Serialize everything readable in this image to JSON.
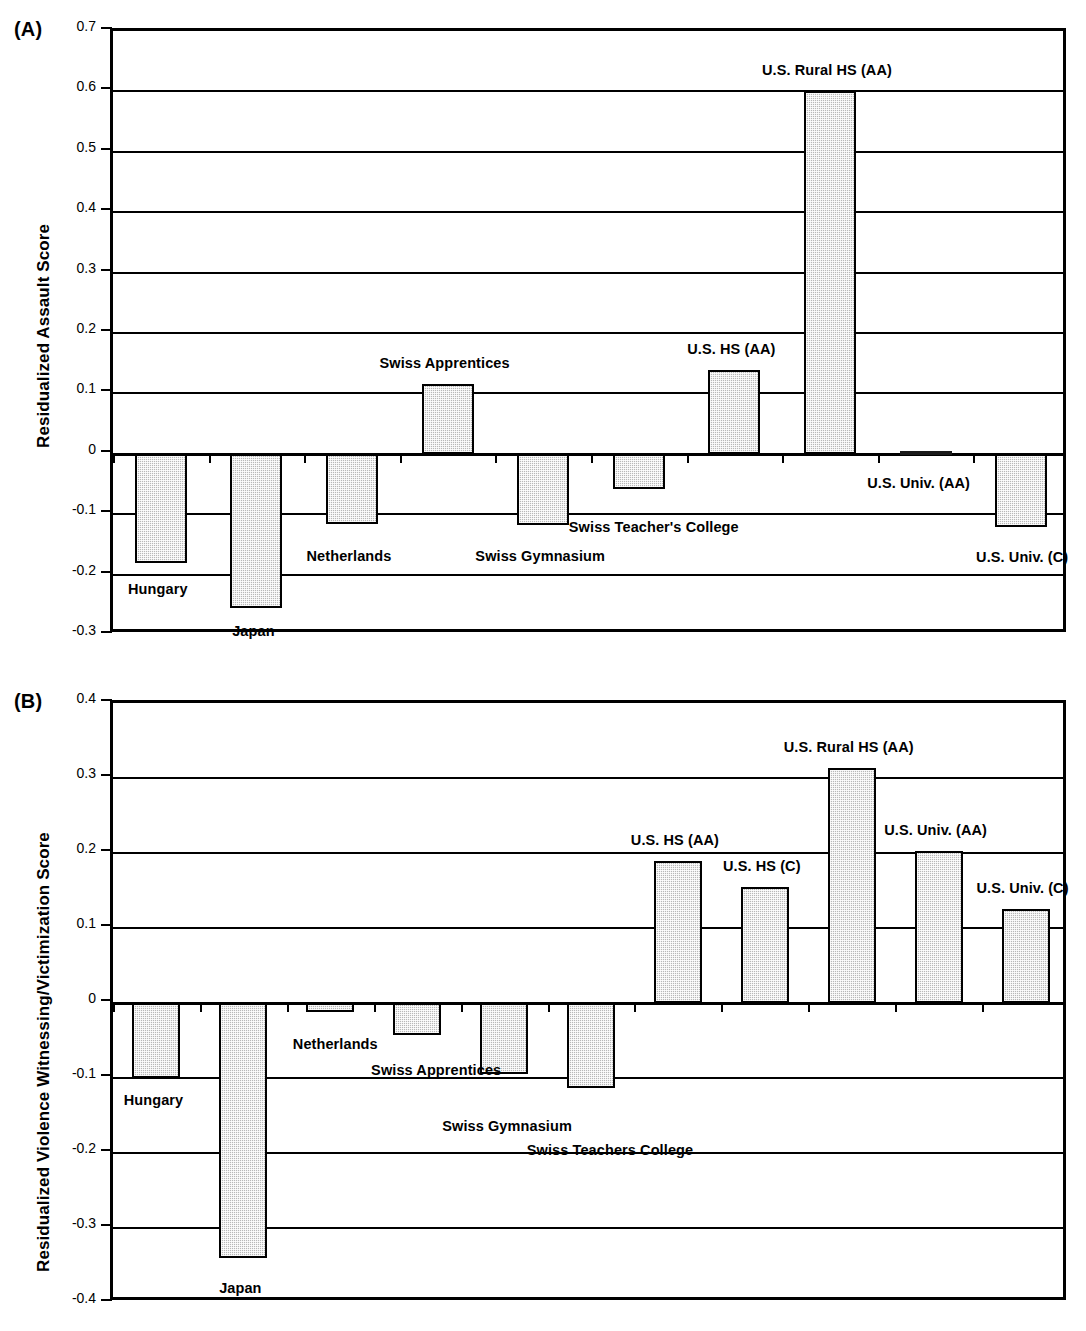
{
  "figure": {
    "panels": [
      {
        "letter": "(A)",
        "ylabel": "Residualized Assault Score"
      },
      {
        "letter": "(B)",
        "ylabel": "Residualized Violence Witnessing/Victimization Score"
      }
    ]
  },
  "chart_data": [
    {
      "type": "bar",
      "title": "(A)",
      "xlabel": "",
      "ylabel": "Residualized Assault Score",
      "ylim": [
        -0.3,
        0.7
      ],
      "ytick_labels": [
        "0.7",
        "0.6",
        "0.5",
        "0.4",
        "0.3",
        "0.2",
        "0.1",
        "0",
        "-0.1",
        "-0.2",
        "-0.3"
      ],
      "ytick_values": [
        0.7,
        0.6,
        0.5,
        0.4,
        0.3,
        0.2,
        0.1,
        0,
        -0.1,
        -0.2,
        -0.3
      ],
      "grid": true,
      "legend": "none",
      "categories": [
        "Hungary",
        "Japan",
        "Netherlands",
        "Swiss Apprentices",
        "Swiss Gymnasium",
        "Swiss Teacher's College",
        "U.S. HS (AA)",
        "U.S. Rural HS (AA)",
        "U.S. Univ. (AA)",
        "U.S. Univ. (C)"
      ],
      "values": [
        -0.181,
        -0.255,
        -0.116,
        0.116,
        -0.118,
        -0.058,
        0.138,
        0.6,
        0.004,
        -0.122
      ]
    },
    {
      "type": "bar",
      "title": "(B)",
      "xlabel": "",
      "ylabel": "Residualized Violence Witnessing/Victimization Score",
      "ylim": [
        -0.4,
        0.4
      ],
      "ytick_labels": [
        "0.4",
        "0.3",
        "0.2",
        "0.1",
        "0",
        "-0.1",
        "-0.2",
        "-0.3",
        "-0.4"
      ],
      "ytick_values": [
        0.4,
        0.3,
        0.2,
        0.1,
        0,
        -0.1,
        -0.2,
        -0.3,
        -0.4
      ],
      "grid": true,
      "legend": "none",
      "categories": [
        "Hungary",
        "Japan",
        "Netherlands",
        "Swiss Apprentices",
        "Swiss Gymnasium",
        "Swiss Teachers College",
        "U.S. HS (AA)",
        "U.S. HS (C)",
        "U.S. Rural HS (AA)",
        "U.S. Univ. (AA)",
        "U.S. Univ. (C)"
      ],
      "values": [
        -0.1,
        -0.34,
        -0.012,
        -0.043,
        -0.095,
        -0.113,
        0.19,
        0.155,
        0.313,
        0.203,
        0.125
      ]
    }
  ],
  "panelA": {
    "letter": "(A)",
    "ylabel": "Residualized Assault Score",
    "yticks": [
      {
        "label": "0.7"
      },
      {
        "label": "0.6"
      },
      {
        "label": "0.5"
      },
      {
        "label": "0.4"
      },
      {
        "label": "0.3"
      },
      {
        "label": "0.2"
      },
      {
        "label": "0.1"
      },
      {
        "label": "0"
      },
      {
        "label": "-0.1"
      },
      {
        "label": "-0.2"
      },
      {
        "label": "-0.3"
      }
    ],
    "bars": [
      {
        "label": "Hungary",
        "value": "-0.181"
      },
      {
        "label": "Japan",
        "value": "-0.255"
      },
      {
        "label": "Netherlands",
        "value": "-0.116"
      },
      {
        "label": "Swiss Apprentices",
        "value": "0.116"
      },
      {
        "label": "Swiss Gymnasium",
        "value": "-0.118"
      },
      {
        "label": "Swiss Teacher's College",
        "value": "-0.058"
      },
      {
        "label": "U.S. HS (AA)",
        "value": "0.138"
      },
      {
        "label": "U.S. Rural HS (AA)",
        "value": "0.600"
      },
      {
        "label": "U.S. Univ. (AA)",
        "value": "0.004"
      },
      {
        "label": "U.S. Univ. (C)",
        "value": "-0.122"
      }
    ]
  },
  "panelB": {
    "letter": "(B)",
    "ylabel": "Residualized Violence Witnessing/Victimization Score",
    "yticks": [
      {
        "label": "0.4"
      },
      {
        "label": "0.3"
      },
      {
        "label": "0.2"
      },
      {
        "label": "0.1"
      },
      {
        "label": "0"
      },
      {
        "label": "-0.1"
      },
      {
        "label": "-0.2"
      },
      {
        "label": "-0.3"
      },
      {
        "label": "-0.4"
      }
    ],
    "bars": [
      {
        "label": "Hungary",
        "value": "-0.100"
      },
      {
        "label": "Japan",
        "value": "-0.340"
      },
      {
        "label": "Netherlands",
        "value": "-0.012"
      },
      {
        "label": "Swiss Apprentices",
        "value": "-0.043"
      },
      {
        "label": "Swiss Gymnasium",
        "value": "-0.095"
      },
      {
        "label": "Swiss Teachers College",
        "value": "-0.113"
      },
      {
        "label": "U.S. HS (AA)",
        "value": "0.190"
      },
      {
        "label": "U.S. HS (C)",
        "value": "0.155"
      },
      {
        "label": "U.S. Rural HS (AA)",
        "value": "0.313"
      },
      {
        "label": "U.S. Univ. (AA)",
        "value": "0.203"
      },
      {
        "label": "U.S. Univ. (C)",
        "value": "0.125"
      }
    ]
  }
}
